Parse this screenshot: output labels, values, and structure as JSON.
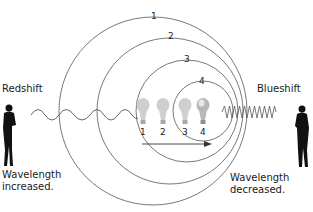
{
  "diagram": {
    "labels": {
      "redshift": "Redshift",
      "blueshift": "Blueshift",
      "left_note_line1": "Wavelength",
      "left_note_line2": "increased.",
      "right_note_line1": "Wavelength",
      "right_note_line2": "decreased."
    },
    "wavefronts": [
      {
        "label": "1",
        "cx": 153,
        "cy": 111,
        "r": 94
      },
      {
        "label": "2",
        "cx": 170,
        "cy": 111,
        "r": 73
      },
      {
        "label": "3",
        "cx": 187,
        "cy": 111,
        "r": 51
      },
      {
        "label": "4",
        "cx": 203,
        "cy": 111,
        "r": 30
      }
    ],
    "bulbs": [
      {
        "label": "1",
        "x": 143
      },
      {
        "label": "2",
        "x": 163
      },
      {
        "label": "3",
        "x": 185
      },
      {
        "label": "4",
        "x": 203
      }
    ],
    "colors": {
      "line": "#555555",
      "bulb": "#c8c8c8",
      "bulb_lit": "#b5b5b5",
      "silhouette": "#111111",
      "text": "#1a1a1a"
    }
  }
}
